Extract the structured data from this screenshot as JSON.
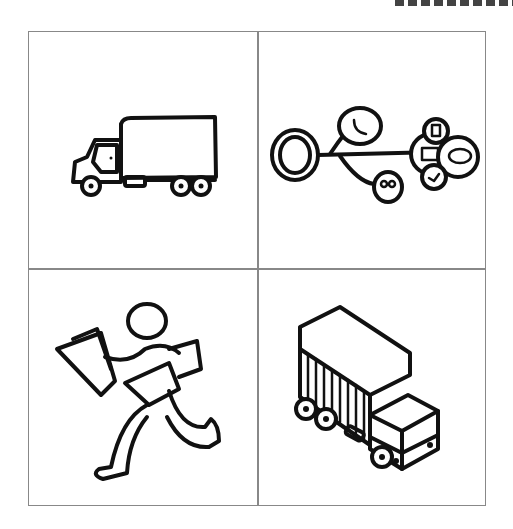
{
  "figure": {
    "layout": "2x2 grid of hand-drawn icons",
    "border_color": "#888888",
    "stroke_color": "#111111",
    "panels": [
      {
        "position": "top-left",
        "icon": "box-truck-side-view-icon"
      },
      {
        "position": "top-right",
        "icon": "communication-network-icon",
        "nodes": [
          "phone-icon",
          "voicemail-icon",
          "mobile-icon",
          "email-icon",
          "chat-bubble-icon",
          "twitter-bird-icon"
        ]
      },
      {
        "position": "bottom-left",
        "icon": "running-courier-icon"
      },
      {
        "position": "bottom-right",
        "icon": "container-truck-isometric-icon"
      }
    ]
  }
}
